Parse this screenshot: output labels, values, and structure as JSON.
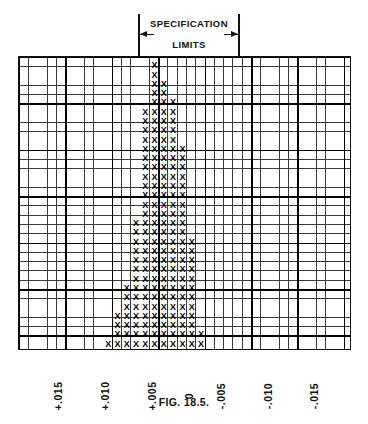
{
  "spec": {
    "line1": "SPECIFICATION",
    "line2": "LIMITS",
    "left_tick_name": "upper-spec-limit",
    "right_tick_name": "lower-spec-limit"
  },
  "caption": "FIG. 18.5.",
  "axis": {
    "tick_labels": [
      "+.015",
      "+.010",
      "+.005",
      "0",
      "-.005",
      "-.010",
      "-.015"
    ],
    "tick_positions_px": [
      64,
      111,
      158,
      195,
      227,
      274,
      320
    ]
  },
  "chart_data": {
    "type": "bar",
    "title": "",
    "subtitle": "SPECIFICATION LIMITS",
    "xlabel": "",
    "ylabel": "",
    "mark_glyph": "X",
    "grid": true,
    "cell_px": 9.28,
    "legend": "none",
    "axis_range_labels": [
      "+.015",
      "+.010",
      "+.005",
      "0",
      "-.005",
      "-.010",
      "-.015"
    ],
    "spec_limit_values": [
      "+.0075",
      "-.0025"
    ],
    "note": "Tally histogram of measured deviations; each X is one observation. Column index 0 is the left (+.019) edge of the grid; categories below give the deviation value for each occupied column.",
    "categories": [
      "+.0115",
      "+.0105",
      "+.0095",
      "+.0085",
      "+.0075",
      "+.0065",
      "+.0055",
      "+.0045",
      "+.0035",
      "+.0025",
      "+.0015",
      "+.0005",
      "-.0005",
      "-.0015",
      "-.0025"
    ],
    "column_indices": [
      9,
      10,
      11,
      12,
      13,
      14,
      15,
      16,
      17,
      18,
      19,
      20,
      21,
      22,
      23
    ],
    "values": [
      5,
      8,
      12,
      13,
      27,
      31,
      31,
      25,
      22,
      20,
      18,
      15,
      13,
      5,
      2
    ],
    "ylim": [
      0,
      31
    ],
    "total_observations": 247
  },
  "marks": {
    "rows": [
      {
        "y": 0,
        "cols": [
          14
        ]
      },
      {
        "y": 1,
        "cols": [
          14
        ]
      },
      {
        "y": 2,
        "cols": [
          14,
          15
        ]
      },
      {
        "y": 3,
        "cols": [
          14,
          15
        ]
      },
      {
        "y": 4,
        "cols": [
          14,
          15,
          16
        ]
      },
      {
        "y": 5,
        "cols": [
          13,
          14,
          15,
          16
        ]
      },
      {
        "y": 6,
        "cols": [
          13,
          14,
          15,
          16
        ]
      },
      {
        "y": 7,
        "cols": [
          13,
          14,
          15,
          16
        ]
      },
      {
        "y": 8,
        "cols": [
          13,
          14,
          15,
          16
        ]
      },
      {
        "y": 9,
        "cols": [
          13,
          14,
          15,
          16,
          17
        ]
      },
      {
        "y": 10,
        "cols": [
          13,
          14,
          15,
          16,
          17
        ]
      },
      {
        "y": 11,
        "cols": [
          13,
          14,
          15,
          16,
          17
        ]
      },
      {
        "y": 12,
        "cols": [
          13,
          14,
          15,
          16,
          17
        ]
      },
      {
        "y": 13,
        "cols": [
          13,
          14,
          15,
          16,
          17
        ]
      },
      {
        "y": 14,
        "cols": [
          13,
          14,
          15,
          16,
          17
        ]
      },
      {
        "y": 15,
        "cols": [
          13,
          14,
          15,
          16,
          17
        ]
      },
      {
        "y": 16,
        "cols": [
          13,
          14,
          15,
          16,
          17
        ]
      },
      {
        "y": 17,
        "cols": [
          12,
          13,
          14,
          15,
          16,
          17
        ]
      },
      {
        "y": 18,
        "cols": [
          12,
          13,
          14,
          15,
          16,
          17
        ]
      },
      {
        "y": 19,
        "cols": [
          12,
          13,
          14,
          15,
          16,
          17,
          18
        ]
      },
      {
        "y": 20,
        "cols": [
          12,
          13,
          14,
          15,
          16,
          17,
          18
        ]
      },
      {
        "y": 21,
        "cols": [
          12,
          13,
          14,
          15,
          16,
          17,
          18
        ]
      },
      {
        "y": 22,
        "cols": [
          12,
          13,
          14,
          15,
          16,
          17,
          18
        ]
      },
      {
        "y": 23,
        "cols": [
          12,
          13,
          14,
          15,
          16,
          17,
          18
        ]
      },
      {
        "y": 24,
        "cols": [
          11,
          12,
          13,
          14,
          15,
          16,
          17,
          18
        ]
      },
      {
        "y": 25,
        "cols": [
          11,
          12,
          13,
          14,
          15,
          16,
          17,
          18
        ]
      },
      {
        "y": 26,
        "cols": [
          11,
          12,
          13,
          14,
          15,
          16,
          17,
          18
        ]
      },
      {
        "y": 27,
        "cols": [
          10,
          11,
          12,
          13,
          14,
          15,
          16,
          17,
          18
        ]
      },
      {
        "y": 28,
        "cols": [
          10,
          11,
          12,
          13,
          14,
          15,
          16,
          17,
          18
        ]
      },
      {
        "y": 29,
        "cols": [
          10,
          11,
          12,
          13,
          14,
          15,
          16,
          17,
          18,
          19
        ]
      },
      {
        "y": 30,
        "cols": [
          9,
          10,
          11,
          12,
          13,
          14,
          15,
          16,
          17,
          18,
          19
        ]
      }
    ]
  }
}
